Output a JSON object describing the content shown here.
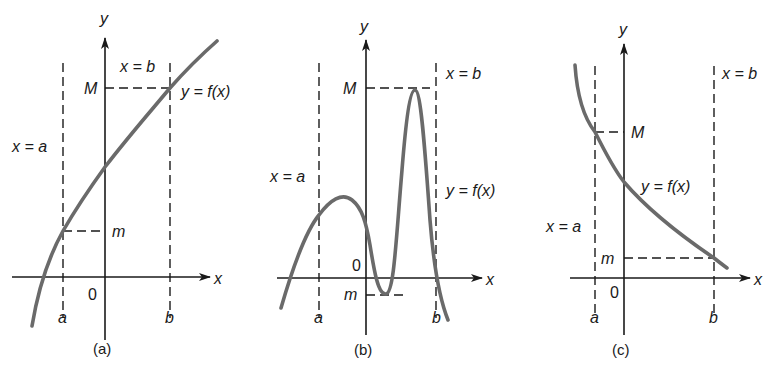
{
  "figure": {
    "panels": [
      {
        "caption": "(a)",
        "y_axis_label": "y",
        "x_axis_label": "x",
        "origin_label": "0",
        "line_a_label": "x = a",
        "line_b_label": "x = b",
        "a_label": "a",
        "b_label": "b",
        "max_label": "M",
        "min_label": "m",
        "curve_label": "y = f(x)",
        "description": "Increasing function; minimum m at x=a, maximum M at x=b"
      },
      {
        "caption": "(b)",
        "y_axis_label": "y",
        "x_axis_label": "x",
        "origin_label": "0",
        "line_a_label": "x = a",
        "line_b_label": "x = b",
        "a_label": "a",
        "b_label": "b",
        "max_label": "M",
        "min_label": "m",
        "curve_label": "y = f(x)",
        "description": "Oscillating function; extrema attained at interior points of [a, b]"
      },
      {
        "caption": "(c)",
        "y_axis_label": "y",
        "x_axis_label": "x",
        "origin_label": "0",
        "line_a_label": "x = a",
        "line_b_label": "x = b",
        "a_label": "a",
        "b_label": "b",
        "max_label": "M",
        "min_label": "m",
        "curve_label": "y = f(x)",
        "description": "Decreasing function; maximum M at x=a, minimum m at x=b"
      }
    ],
    "colors": {
      "ink": "#1a1a1a",
      "curve": "#6a6a6a",
      "background": "#ffffff"
    }
  }
}
